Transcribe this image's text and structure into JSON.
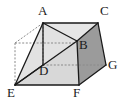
{
  "figure": {
    "type": "geometry-diagram-3d",
    "canvas": {
      "width": 124,
      "height": 107,
      "background": "#ffffff"
    },
    "colors": {
      "stroke": "#1a1a1a",
      "hidden_stroke": "#8a8a8a",
      "face_right_fill": "#9b9b9b",
      "face_front_fill": "#d8d8d8",
      "face_top_fill": "#e6e6e6",
      "face_inner_fill": "#e2e2e2",
      "label_color": "#1a1a1a"
    },
    "vertices": [
      {
        "id": "A",
        "label": "A",
        "x": 43,
        "y": 23,
        "visible": true,
        "label_x": 38,
        "label_y": 7
      },
      {
        "id": "C",
        "label": "C",
        "x": 98,
        "y": 23,
        "visible": true,
        "label_x": 100,
        "label_y": 7
      },
      {
        "id": "B",
        "label": "B",
        "x": 77,
        "y": 41,
        "visible": true,
        "label_x": 79,
        "label_y": 40
      },
      {
        "id": "G",
        "label": "G",
        "x": 106,
        "y": 65,
        "visible": true,
        "label_x": 108,
        "label_y": 60
      },
      {
        "id": "D",
        "label": "D",
        "x": 43,
        "y": 65,
        "visible": true,
        "label_x": 40,
        "label_y": 66
      },
      {
        "id": "E",
        "label": "E",
        "x": 15,
        "y": 85,
        "visible": true,
        "label_x": 9,
        "label_y": 87
      },
      {
        "id": "F",
        "label": "F",
        "x": 79,
        "y": 85,
        "visible": true,
        "label_x": 74,
        "label_y": 87
      },
      {
        "id": "H",
        "label": "",
        "x": 15,
        "y": 43,
        "visible": false,
        "label_x": 0,
        "label_y": 0
      }
    ],
    "solid_edges": [
      {
        "name": "A-C",
        "from": "A",
        "to": "C"
      },
      {
        "name": "C-G",
        "from": "C",
        "to": "G"
      },
      {
        "name": "G-F",
        "from": "G",
        "to": "F"
      },
      {
        "name": "F-E",
        "from": "F",
        "to": "E"
      },
      {
        "name": "E-A",
        "from": "E",
        "to": "A"
      },
      {
        "name": "A-B",
        "from": "A",
        "to": "B"
      },
      {
        "name": "B-F",
        "from": "B",
        "to": "F"
      },
      {
        "name": "B-C",
        "from": "B",
        "to": "C"
      },
      {
        "name": "E-B",
        "from": "E",
        "to": "B"
      },
      {
        "name": "A-D",
        "from": "A",
        "to": "D"
      },
      {
        "name": "E-D",
        "from": "E",
        "to": "D"
      }
    ],
    "hidden_edges": [
      {
        "name": "H-A",
        "from": "H",
        "to": "A"
      },
      {
        "name": "H-E",
        "from": "H",
        "to": "E"
      },
      {
        "name": "H-D",
        "from": "H",
        "to": "D"
      },
      {
        "name": "A-D-hidden",
        "from": "A",
        "to": "D"
      },
      {
        "name": "D-G",
        "from": "D",
        "to": "G"
      },
      {
        "name": "D-B-hidden",
        "from": "D",
        "to": "B"
      }
    ],
    "faces": [
      {
        "name": "face-right-BCGF",
        "fill_key": "face_right_fill",
        "points": "77,41 98,23 106,65 79,85"
      },
      {
        "name": "face-front-EDBF",
        "fill_key": "face_front_fill",
        "points": "15,85 43,65 77,41 79,85"
      },
      {
        "name": "face-top-ABC",
        "fill_key": "face_top_fill",
        "points": "43,23 98,23 77,41"
      },
      {
        "name": "face-inner-AEB",
        "fill_key": "face_inner_fill",
        "points": "43,23 15,85 77,41"
      }
    ]
  }
}
